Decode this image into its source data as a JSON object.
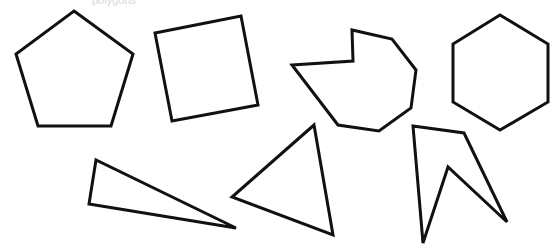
{
  "diagram": {
    "caption": "polygons",
    "stroke_color": "#111111",
    "fill_color": "#ffffff",
    "background": "#ffffff",
    "shapes": [
      {
        "name": "pentagon",
        "kind": "regular pentagon",
        "sides": 5
      },
      {
        "name": "square",
        "kind": "rotated square",
        "sides": 4
      },
      {
        "name": "irregular-octagon",
        "kind": "irregular concave polygon",
        "sides": 8
      },
      {
        "name": "hexagon",
        "kind": "regular hexagon",
        "sides": 6
      },
      {
        "name": "thin-triangle",
        "kind": "obtuse scalene triangle",
        "sides": 3
      },
      {
        "name": "triangle",
        "kind": "scalene triangle",
        "sides": 3
      },
      {
        "name": "concave-quadrilateral",
        "kind": "concave polygon",
        "sides": 5
      }
    ]
  }
}
